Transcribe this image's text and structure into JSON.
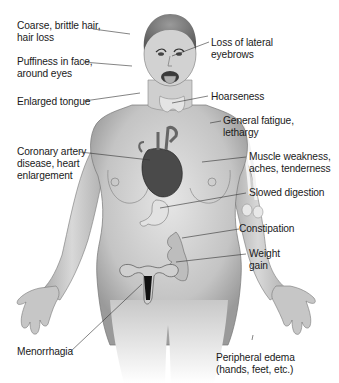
{
  "figure": {
    "labels": {
      "hair": {
        "line1": "Coarse, brittle hair,",
        "line2": "hair loss"
      },
      "face": {
        "line1": "Puffiness in face,",
        "line2": "around eyes"
      },
      "tongue": {
        "line1": "Enlarged tongue"
      },
      "eyebrows": {
        "line1": "Loss of lateral",
        "line2": "eyebrows"
      },
      "hoarseness": {
        "line1": "Hoarseness"
      },
      "fatigue": {
        "line1": "General fatigue,",
        "line2": "lethargy"
      },
      "heart": {
        "line1": "Coronary artery",
        "line2": "disease, heart",
        "line3": "enlargement"
      },
      "muscle": {
        "line1": "Muscle weakness,",
        "line2": "aches, tenderness"
      },
      "digestion": {
        "line1": "Slowed digestion"
      },
      "constipation": {
        "line1": "Constipation"
      },
      "weight": {
        "line1": "Weight",
        "line2": "gain"
      },
      "menorrhagia": {
        "line1": "Menorrhagia"
      },
      "edema": {
        "line1": "Peripheral edema",
        "line2": "(hands, feet, etc.)"
      }
    },
    "colors": {
      "text": "#1a1a1a",
      "skin": "#c9c9c9",
      "skin_dark": "#8a8a8a",
      "line": "#333333"
    }
  }
}
